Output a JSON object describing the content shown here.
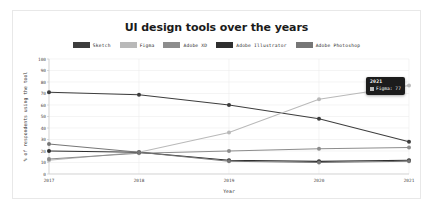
{
  "card": {
    "background": "#ffffff",
    "border_color": "#e8e8e8"
  },
  "chart_data": {
    "type": "line",
    "title": "UI design tools over the years",
    "xlabel": "Year",
    "ylabel": "% of respondents using the tool",
    "categories": [
      "2017",
      "2018",
      "2019",
      "2020",
      "2021"
    ],
    "x": [
      2017,
      2018,
      2019,
      2020,
      2021
    ],
    "xlim": [
      2017,
      2021
    ],
    "ylim": [
      0,
      100
    ],
    "yticks": [
      0,
      10,
      20,
      30,
      40,
      50,
      60,
      70,
      80,
      90,
      100
    ],
    "grid": true,
    "legend_position": "top",
    "markers": true,
    "series": [
      {
        "name": "Sketch",
        "color": "#3d3d3d",
        "values": [
          71,
          69,
          60,
          48,
          28
        ]
      },
      {
        "name": "Figma",
        "color": "#b9b9b9",
        "values": [
          12,
          19,
          36,
          65,
          77
        ]
      },
      {
        "name": "Adobe XD",
        "color": "#8d8d8d",
        "values": [
          13,
          18,
          20,
          22,
          23
        ]
      },
      {
        "name": "Adobe Illustrator",
        "color": "#2f2f2f",
        "values": [
          20,
          19,
          12,
          11,
          12
        ]
      },
      {
        "name": "Adobe Photoshop",
        "color": "#767676",
        "values": [
          26,
          19,
          11,
          10,
          11
        ]
      }
    ]
  },
  "tooltip": {
    "visible": true,
    "title": "2021",
    "series_name": "Figma",
    "value": "77",
    "label": "Figma: 77",
    "swatch_color": "#b9b9b9",
    "background": "#1c1c1c",
    "text_color": "#ffffff"
  }
}
